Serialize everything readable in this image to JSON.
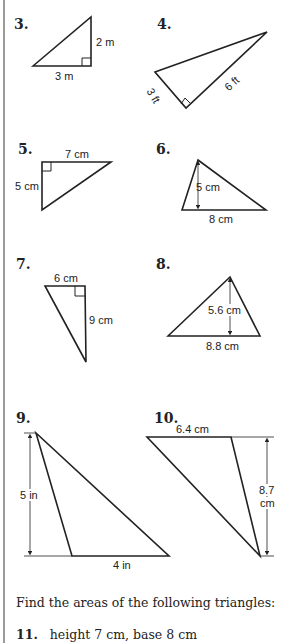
{
  "problems": [
    {
      "number": "3.",
      "labels": [
        "2 m",
        "3 m"
      ]
    },
    {
      "number": "4.",
      "labels": [
        "3 ft",
        "6 ft"
      ]
    },
    {
      "number": "5.",
      "labels": [
        "7 cm",
        "5 cm"
      ]
    },
    {
      "number": "6.",
      "labels": [
        "5 cm",
        "8 cm"
      ]
    },
    {
      "number": "7.",
      "labels": [
        "6 cm",
        "9 cm"
      ]
    },
    {
      "number": "8.",
      "labels": [
        "5.6 cm",
        "8.8 cm"
      ]
    },
    {
      "number": "9.",
      "labels": [
        "5 in",
        "4 in"
      ]
    },
    {
      "number": "10.",
      "labels": [
        "6.4 cm",
        "8.7",
        "cm"
      ]
    }
  ],
  "instructions": "Find the areas of the following triangles:",
  "item11": {
    "number": "11.",
    "text": "height 7 cm, base 8 cm"
  }
}
